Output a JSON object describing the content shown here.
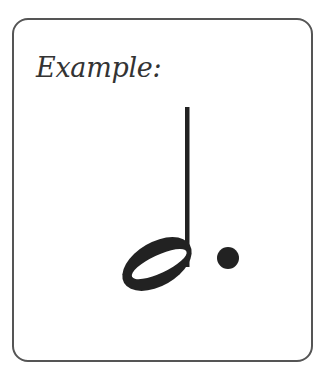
{
  "card": {
    "caption": "Example:"
  },
  "figure": {
    "symbol": "dotted-half-note",
    "colors": {
      "ink": "#222222",
      "border": "#555555",
      "background": "#ffffff"
    }
  }
}
